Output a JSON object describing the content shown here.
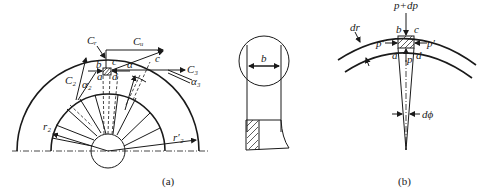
{
  "figure_a": {
    "caption": "(a)",
    "labels": {
      "Cr": "Cᵣ",
      "Cu": "Cᵤ",
      "c_upper": "c",
      "C3": "C₃",
      "alpha3": "α₃",
      "C2": "C₂",
      "alpha2": "α₂",
      "b": "b",
      "c": "c",
      "a": "a",
      "d": "d",
      "alpha": "α",
      "r2": "r₂",
      "r2prime": "r′₂"
    }
  },
  "figure_mid": {
    "labels": {
      "b": "b"
    }
  },
  "figure_b": {
    "caption": "(b)",
    "labels": {
      "p_dp": "p+dp",
      "dr": "dr",
      "b": "b",
      "c": "c",
      "p_prime_left": "p′",
      "p_prime_right": "p′",
      "a": "a",
      "p": "p",
      "d": "d",
      "dphi": "dϕ"
    }
  }
}
